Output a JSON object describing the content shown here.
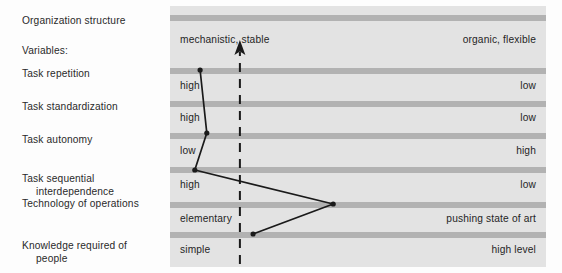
{
  "title_block": {
    "heading": "Organization structure",
    "subheading": "Variables:"
  },
  "rows": [
    {
      "label_line1": "Task repetition",
      "label_line2": "",
      "left_value": "high",
      "right_value": "low"
    },
    {
      "label_line1": "Task standardization",
      "label_line2": "",
      "left_value": "high",
      "right_value": "low"
    },
    {
      "label_line1": "Task autonomy",
      "label_line2": "",
      "left_value": "low",
      "right_value": "high"
    },
    {
      "label_line1": "Task sequential",
      "label_line2": "interdependence",
      "left_value": "high",
      "right_value": "low"
    },
    {
      "label_line1": "Technology of operations",
      "label_line2": "",
      "left_value": "elementary",
      "right_value": "pushing state of art"
    },
    {
      "label_line1": "Knowledge required of",
      "label_line2": "people",
      "left_value": "simple",
      "right_value": "high level"
    }
  ],
  "axis": {
    "left_pole": "mechanistic, stable",
    "right_pole": "organic, flexible"
  },
  "colors": {
    "panel_background": "#e3e3e3",
    "band": "#b2b2b2",
    "text": "#252525",
    "line": "#1a1a1a"
  },
  "chart_data": {
    "type": "line",
    "title": "Organization structure",
    "xlabel": "",
    "ylabel": "",
    "categories": [
      "Task repetition",
      "Task standardization",
      "Task autonomy",
      "Task sequential interdependence",
      "Technology of operations",
      "Knowledge required of people"
    ],
    "left_pole_label": "mechanistic, stable",
    "right_pole_label": "organic, flexible",
    "left_scale_labels": [
      "high",
      "high",
      "low",
      "high",
      "elementary",
      "simple"
    ],
    "right_scale_labels": [
      "low",
      "low",
      "high",
      "low",
      "pushing state of art",
      "high level"
    ],
    "points": [
      {
        "category": "Task repetition",
        "x_pct": 8.0,
        "y_px": 64
      },
      {
        "category": "Task standardization",
        "x_pct": 9.8,
        "y_px": 127
      },
      {
        "category": "Task autonomy",
        "x_pct": 6.6,
        "y_px": 164
      },
      {
        "category": "Technology of operations",
        "x_pct": 43.4,
        "y_px": 198
      },
      {
        "category": "Knowledge required of people",
        "x_pct": 22.1,
        "y_px": 228
      }
    ],
    "reference_arrow": {
      "style": "dashed",
      "direction": "up",
      "x_pct": 18.6,
      "y_top_px": 38,
      "y_bottom_px": 258
    },
    "grid": true,
    "legend": "none"
  }
}
